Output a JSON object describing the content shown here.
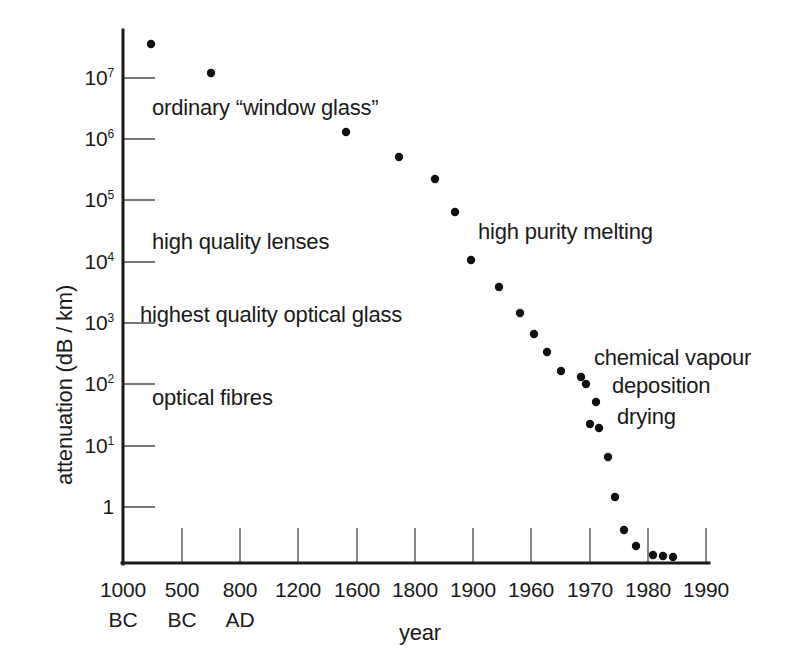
{
  "chart_data": {
    "type": "scatter",
    "title": "",
    "xlabel": "year",
    "ylabel": "attenuation (dB / km)",
    "grid": false,
    "legend": "none",
    "yscale": "log",
    "y_tick_labels": [
      "10",
      "10",
      "10",
      "10",
      "10",
      "10",
      "10",
      "1"
    ],
    "y_tick_exponents": [
      "7",
      "6",
      "5",
      "4",
      "3",
      "2",
      "1",
      ""
    ],
    "y_tick_values": [
      10000000,
      1000000,
      100000,
      10000,
      1000,
      100,
      10,
      1
    ],
    "x_tick_labels": [
      "1000",
      "500",
      "800",
      "1200",
      "1600",
      "1800",
      "1900",
      "1960",
      "1970",
      "1980",
      "1990"
    ],
    "x_tick_sublabels": [
      "BC",
      "BC",
      "AD",
      "",
      "",
      "",
      "",
      "",
      "",
      "",
      ""
    ],
    "x_tick_positions_px": [
      123,
      182,
      240,
      298,
      357,
      415,
      473,
      531,
      590,
      648,
      706
    ],
    "points_px": [
      {
        "x": 151,
        "y": 44
      },
      {
        "x": 211,
        "y": 73
      },
      {
        "x": 346,
        "y": 132
      },
      {
        "x": 399,
        "y": 157
      },
      {
        "x": 435,
        "y": 179
      },
      {
        "x": 455,
        "y": 212
      },
      {
        "x": 471,
        "y": 260
      },
      {
        "x": 499,
        "y": 287
      },
      {
        "x": 520,
        "y": 313
      },
      {
        "x": 534,
        "y": 334
      },
      {
        "x": 547,
        "y": 352
      },
      {
        "x": 561,
        "y": 371
      },
      {
        "x": 581,
        "y": 377
      },
      {
        "x": 586,
        "y": 384
      },
      {
        "x": 596,
        "y": 402
      },
      {
        "x": 590,
        "y": 424
      },
      {
        "x": 599,
        "y": 428
      },
      {
        "x": 608,
        "y": 457
      },
      {
        "x": 615,
        "y": 497
      },
      {
        "x": 624,
        "y": 530
      },
      {
        "x": 636,
        "y": 546
      },
      {
        "x": 653,
        "y": 555
      },
      {
        "x": 663,
        "y": 556
      },
      {
        "x": 673,
        "y": 557
      }
    ],
    "annotations": [
      {
        "text": "ordinary “window glass”",
        "x": 152,
        "y": 95
      },
      {
        "text": "high quality lenses",
        "x": 152,
        "y": 229
      },
      {
        "text": "highest quality optical glass",
        "x": 140,
        "y": 302
      },
      {
        "text": "optical fibres",
        "x": 152,
        "y": 385
      },
      {
        "text": "high purity melting",
        "x": 478,
        "y": 219
      },
      {
        "text": "chemical vapour",
        "x": 594,
        "y": 345
      },
      {
        "text": "deposition",
        "x": 612,
        "y": 373
      },
      {
        "text": "drying",
        "x": 617,
        "y": 404
      }
    ]
  },
  "axes": {
    "y_axis_title": "attenuation (dB / km)",
    "x_axis_title": "year"
  }
}
